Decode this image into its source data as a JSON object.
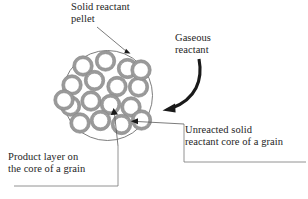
{
  "figure": {
    "type": "diagram",
    "background_color": "#ffffff"
  },
  "labels": {
    "pellet": "Solid reactant\npellet",
    "gaseous": "Gaseous\nreactant",
    "unreacted": "Unreacted solid\nreactant core of a grain",
    "product": "Product layer on\nthe core of a grain"
  },
  "colors": {
    "text": "#252525",
    "pellet_outline": "#6e6e6e",
    "grain_ring": "#9a9a9a",
    "grain_ring_stroke": "#8a8a8a",
    "grain_core": "#ffffff",
    "leader_line": "#5a5a5a",
    "arrow": "#1a1a1a"
  },
  "pellet": {
    "center_x": 107.5,
    "center_y": 95.5,
    "radius": 45,
    "grain_count": 17,
    "grain_outer_radius": 10.2,
    "grain_inner_radius": 7.3,
    "grains": [
      {
        "cx": 83.0,
        "cy": 66.0
      },
      {
        "cx": 105.5,
        "cy": 61.0
      },
      {
        "cx": 127.5,
        "cy": 68.5
      },
      {
        "cx": 72.0,
        "cy": 85.0
      },
      {
        "cx": 94.5,
        "cy": 80.5
      },
      {
        "cx": 117.0,
        "cy": 86.5
      },
      {
        "cx": 138.5,
        "cy": 87.0
      },
      {
        "cx": 70.5,
        "cy": 106.0
      },
      {
        "cx": 91.0,
        "cy": 101.0
      },
      {
        "cx": 110.5,
        "cy": 104.5
      },
      {
        "cx": 131.0,
        "cy": 107.0
      },
      {
        "cx": 80.0,
        "cy": 123.0
      },
      {
        "cx": 100.5,
        "cy": 120.5
      },
      {
        "cx": 121.5,
        "cy": 124.5
      },
      {
        "cx": 141.0,
        "cy": 70.0
      },
      {
        "cx": 141.5,
        "cy": 120.0
      },
      {
        "cx": 64.0,
        "cy": 100.0
      }
    ]
  },
  "annotations": {
    "pellet_leader": {
      "from_x": 97,
      "from_y": 27,
      "to_x": 128,
      "to_y": 53
    },
    "gas_arrow": {
      "start_x": 199,
      "start_y": 60,
      "end_x": 163,
      "end_y": 110
    },
    "unreacted_leader": {
      "corner_x": 184,
      "corner_y": 124,
      "bottom_y": 162,
      "right_x": 306,
      "arrow_x": 131,
      "arrow_y": 121
    },
    "product_leader": {
      "corner_x": 118,
      "corner_y": 186,
      "left_x": 14,
      "arrow_x": 114,
      "arrow_y": 110
    }
  }
}
